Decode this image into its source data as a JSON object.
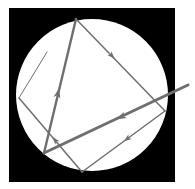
{
  "diagram": {
    "title": "",
    "canvas": {
      "width": 195,
      "height": 189,
      "background": "#ffffff"
    },
    "frame": {
      "x": 9,
      "y": 8,
      "width": 166,
      "height": 174,
      "color": "#000000"
    },
    "circle": {
      "cx": 92,
      "cy": 95,
      "r": 76,
      "color": "#ffffff"
    },
    "ray_color": "#6e6e6e",
    "segments": [
      {
        "id": "incident-ray",
        "x1": 188,
        "y1": 85,
        "x2": 44,
        "y2": 153,
        "width": 3,
        "arrow": {
          "x": 121,
          "y": 117
        }
      },
      {
        "id": "reflection-1",
        "x1": 44,
        "y1": 153,
        "x2": 76,
        "y2": 19,
        "width": 2.4,
        "arrow": {
          "x": 58,
          "y": 93
        }
      },
      {
        "id": "reflection-2",
        "x1": 76,
        "y1": 19,
        "x2": 165,
        "y2": 111,
        "width": 1.5,
        "arrow": {
          "x": 112,
          "y": 56
        }
      },
      {
        "id": "reflection-3",
        "x1": 165,
        "y1": 111,
        "x2": 82,
        "y2": 172,
        "width": 1.5,
        "arrow": {
          "x": 127,
          "y": 139
        }
      },
      {
        "id": "reflection-4",
        "x1": 82,
        "y1": 172,
        "x2": 19,
        "y2": 98,
        "width": 1.5,
        "arrow": {
          "x": 55,
          "y": 140
        }
      },
      {
        "id": "reflection-5",
        "x1": 19,
        "y1": 98,
        "x2": 47,
        "y2": 52,
        "width": 1,
        "arrow": null
      }
    ],
    "labels": []
  }
}
